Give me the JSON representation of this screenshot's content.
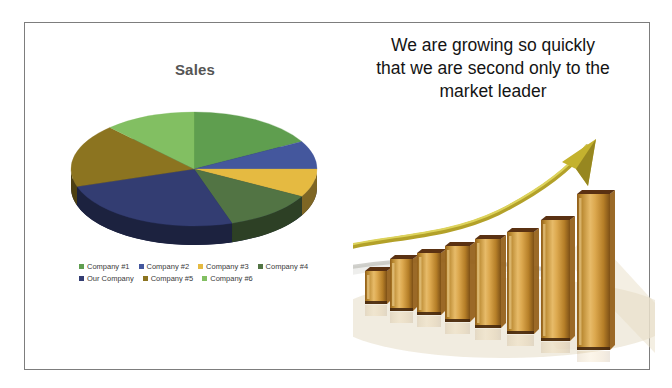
{
  "slide": {
    "background": "#ffffff",
    "border_color": "#7d7d7d"
  },
  "caption": {
    "text": "We are growing so quickly that we are second only to the market leader",
    "lines": [
      "We are growing so quickly",
      "that we are second only to the",
      "market leader"
    ]
  },
  "chart_data": [
    {
      "type": "pie",
      "style": "3d",
      "title": "Sales",
      "labels": [
        "Company #1",
        "Company #2",
        "Company #3",
        "Company #4",
        "Our Company",
        "Company #5",
        "Company #6"
      ],
      "values": [
        17,
        8,
        8,
        12,
        25,
        18,
        12
      ],
      "values_estimated": true,
      "colors": [
        "#5f9e4f",
        "#44579d",
        "#e5ba41",
        "#527444",
        "#333d72",
        "#8c7420",
        "#82bf62"
      ],
      "legend_position": "bottom",
      "legend_rows": [
        [
          0,
          1,
          2,
          3
        ],
        [
          4,
          5,
          6
        ]
      ]
    },
    {
      "type": "bar",
      "title": "",
      "description": "3D golden glass bars rising left to right with a gold growth arrow",
      "values": [
        33,
        52,
        62,
        76,
        89,
        102,
        121,
        156
      ],
      "values_estimated": true,
      "bar_color": "#c99136",
      "cap_color": "#5a3112",
      "arrow_color": "#c4b22e"
    }
  ]
}
